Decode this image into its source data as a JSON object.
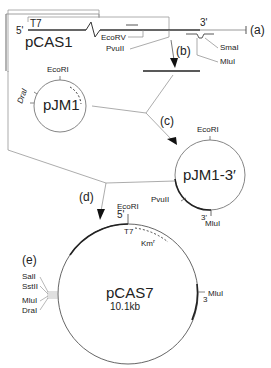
{
  "figure": {
    "type": "plasmid construction scheme",
    "steps": [
      "(a)",
      "(b)",
      "(c)",
      "(d)",
      "(e)"
    ]
  },
  "pCAS1": {
    "name": "pCAS1",
    "five_prime": "5'",
    "three_prime": "3'",
    "promoter": "T7",
    "sites": [
      "EcoRV",
      "PvuII",
      "SmaI",
      "MluI"
    ],
    "step_label": "(a)"
  },
  "step_b": {
    "label": "(b)"
  },
  "pJM1": {
    "name": "pJM1",
    "sites": [
      "EcoRI",
      "DraI"
    ]
  },
  "step_c": {
    "label": "(c)"
  },
  "pJM1_3": {
    "name": "pJM1-3′",
    "sites": [
      "EcoRI",
      "PvuII",
      "MluI"
    ],
    "three_prime": "3'"
  },
  "step_d": {
    "label": "(d)"
  },
  "pCAS7": {
    "name": "pCAS7",
    "size": "10.1kb",
    "five_prime": "5'",
    "three_prime": "3",
    "promoter": "T7",
    "marker": "Km",
    "marker_sup": "r",
    "top_site": "EcoRI",
    "right_site": "MluI",
    "polylinker_sites": [
      "SalI",
      "SstII",
      "MluI",
      "DraI"
    ]
  },
  "step_e": {
    "label": "(e)"
  }
}
